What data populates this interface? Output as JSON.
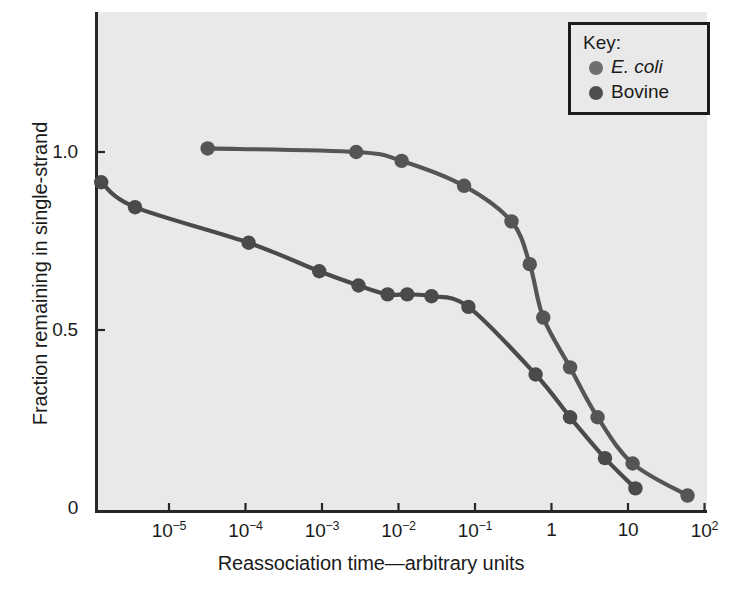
{
  "chart_data": {
    "type": "line",
    "title": "",
    "xlabel": "Reassociation time—arbitrary units",
    "ylabel": "Fraction remaining in single-strand",
    "xscale": "log",
    "xlim": [
      1.2e-06,
      160
    ],
    "ylim": [
      0,
      1.18
    ],
    "grid": false,
    "legend_position": "top-right",
    "legend_title": "Key:",
    "x_tick_labels": [
      "10−5",
      "10−4",
      "10−3",
      "10−2",
      "10−1",
      "1",
      "10",
      "10²"
    ],
    "x_tick_values": [
      1e-05,
      0.0001,
      0.001,
      0.01,
      0.1,
      1,
      10,
      100
    ],
    "y_tick_labels": [
      "1.0",
      "0.5",
      "0"
    ],
    "y_tick_values": [
      1.0,
      0.5,
      0
    ],
    "series": [
      {
        "name": "E. coli",
        "name_italic": true,
        "color": "#555555",
        "marker": "circle",
        "points": [
          {
            "x": 3.2e-05,
            "y": 1.01
          },
          {
            "x": 0.0028,
            "y": 1.0
          },
          {
            "x": 0.011,
            "y": 0.975
          },
          {
            "x": 0.072,
            "y": 0.905
          },
          {
            "x": 0.3,
            "y": 0.805
          },
          {
            "x": 0.52,
            "y": 0.685
          },
          {
            "x": 0.78,
            "y": 0.535
          },
          {
            "x": 1.75,
            "y": 0.395
          },
          {
            "x": 4.0,
            "y": 0.255
          },
          {
            "x": 11.5,
            "y": 0.125
          },
          {
            "x": 60.0,
            "y": 0.035
          }
        ]
      },
      {
        "name": "Bovine",
        "name_italic": false,
        "color": "#4a4a4a",
        "marker": "circle",
        "points": [
          {
            "x": 1.3e-06,
            "y": 0.915
          },
          {
            "x": 3.6e-06,
            "y": 0.845
          },
          {
            "x": 0.00011,
            "y": 0.745
          },
          {
            "x": 0.00092,
            "y": 0.665
          },
          {
            "x": 0.003,
            "y": 0.625
          },
          {
            "x": 0.0072,
            "y": 0.6
          },
          {
            "x": 0.013,
            "y": 0.6
          },
          {
            "x": 0.027,
            "y": 0.595
          },
          {
            "x": 0.082,
            "y": 0.565
          },
          {
            "x": 0.62,
            "y": 0.375
          },
          {
            "x": 1.75,
            "y": 0.255
          },
          {
            "x": 5.0,
            "y": 0.14
          },
          {
            "x": 12.5,
            "y": 0.055
          }
        ]
      }
    ]
  },
  "axes": {
    "x_title": "Reassociation time—arbitrary units",
    "y_title": "Fraction remaining in single-strand",
    "x_ticks": [
      {
        "label_base": "10",
        "label_exp": "−5"
      },
      {
        "label_base": "10",
        "label_exp": "−4"
      },
      {
        "label_base": "10",
        "label_exp": "−3"
      },
      {
        "label_base": "10",
        "label_exp": "−2"
      },
      {
        "label_base": "10",
        "label_exp": "−1"
      },
      {
        "label_base": "1",
        "label_exp": ""
      },
      {
        "label_base": "10",
        "label_exp": ""
      },
      {
        "label_base": "10",
        "label_exp": "2"
      }
    ],
    "y_ticks": [
      {
        "label": "1.0"
      },
      {
        "label": "0.5"
      },
      {
        "label": "0"
      }
    ]
  },
  "legend": {
    "title": "Key:",
    "entries": [
      {
        "label": "E. coli",
        "color": "#6e6e6e"
      },
      {
        "label": "Bovine",
        "color": "#4f4f4f"
      }
    ]
  },
  "colors": {
    "plot_background": "#e9e9e9",
    "page_background": "#ffffff",
    "axis": "#262626",
    "text": "#1b1b1b",
    "ecoli_line": "#555555",
    "bovine_line": "#4a4a4a"
  }
}
